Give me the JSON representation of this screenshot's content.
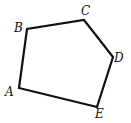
{
  "diagram": {
    "type": "pentagon",
    "stroke_color": "#111111",
    "vertices": [
      {
        "name": "A",
        "label": "A",
        "x": 19,
        "y": 88,
        "lx": 5,
        "ly": 96
      },
      {
        "name": "B",
        "label": "B",
        "x": 27,
        "y": 29,
        "lx": 14,
        "ly": 32
      },
      {
        "name": "C",
        "label": "C",
        "x": 84,
        "y": 20,
        "lx": 81,
        "ly": 15
      },
      {
        "name": "D",
        "label": "D",
        "x": 113,
        "y": 57,
        "lx": 114,
        "ly": 62
      },
      {
        "name": "E",
        "label": "E",
        "x": 97,
        "y": 107,
        "lx": 95,
        "ly": 118
      }
    ]
  }
}
